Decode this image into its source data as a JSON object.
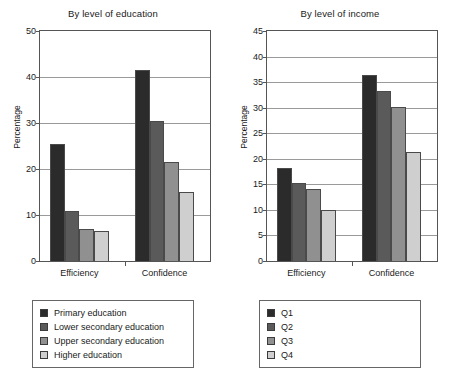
{
  "figure": {
    "background": "#ffffff",
    "series_colors": [
      "#2b2b2b",
      "#5a5a5a",
      "#909090",
      "#cfcfcf"
    ]
  },
  "chart_data": [
    {
      "type": "bar",
      "title": "By level of education",
      "xlabel": "",
      "ylabel": "Percentage",
      "categories": [
        "Efficiency",
        "Confidence"
      ],
      "ylim": [
        0,
        50
      ],
      "yticks": [
        0,
        10,
        20,
        30,
        40,
        50
      ],
      "grid": true,
      "legend_position": "below",
      "series": [
        {
          "name": "Primary education",
          "color": "#2b2b2b",
          "values": [
            25.5,
            41.6
          ]
        },
        {
          "name": "Lower secondary education",
          "color": "#5a5a5a",
          "values": [
            10.9,
            30.5
          ]
        },
        {
          "name": "Upper secondary education",
          "color": "#909090",
          "values": [
            7.0,
            21.5
          ]
        },
        {
          "name": "Higher education",
          "color": "#cfcfcf",
          "values": [
            6.6,
            14.9
          ]
        }
      ]
    },
    {
      "type": "bar",
      "title": "By level of income",
      "xlabel": "",
      "ylabel": "Percentage",
      "categories": [
        "Efficiency",
        "Confidence"
      ],
      "ylim": [
        0,
        45
      ],
      "yticks": [
        0,
        5,
        10,
        15,
        20,
        25,
        30,
        35,
        40,
        45
      ],
      "grid": true,
      "legend_position": "below",
      "series": [
        {
          "name": "Q1",
          "color": "#2b2b2b",
          "values": [
            18.2,
            36.3
          ]
        },
        {
          "name": "Q2",
          "color": "#5a5a5a",
          "values": [
            15.3,
            33.3
          ]
        },
        {
          "name": "Q3",
          "color": "#909090",
          "values": [
            14.1,
            30.1
          ]
        },
        {
          "name": "Q4",
          "color": "#cfcfcf",
          "values": [
            9.9,
            21.4
          ]
        }
      ]
    }
  ]
}
